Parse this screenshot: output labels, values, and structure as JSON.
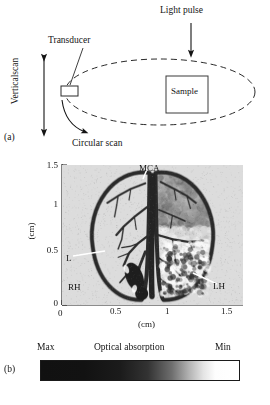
{
  "figure": {
    "panel_a_label": "(a)",
    "panel_b_label": "(b)"
  },
  "schematic": {
    "light_pulse": "Light pulse",
    "transducer": "Transducer",
    "sample": "Sample",
    "circular_scan": "Circular scan",
    "vertical_scan": "Verticalscan"
  },
  "image_panel": {
    "annotations": {
      "mca": "MCA",
      "l": "L",
      "rh": "RH",
      "lh": "LH"
    },
    "x_axis": {
      "title": "(cm)",
      "ticks": [
        "0",
        "0.5",
        "1",
        "1.5"
      ]
    },
    "y_axis": {
      "title": "(cm)",
      "ticks": [
        "1.5",
        "1",
        "0.5",
        "0"
      ]
    }
  },
  "colorbar": {
    "max_label": "Max",
    "title": "Optical absorption",
    "min_label": "Min",
    "max_color": "#111111",
    "min_color": "#ffffff"
  },
  "chart_data": {
    "type": "heatmap",
    "xlabel": "(cm)",
    "ylabel": "(cm)",
    "xlim": [
      0,
      1.5
    ],
    "ylim": [
      0,
      1.5
    ],
    "xticks": [
      0,
      0.5,
      1,
      1.5
    ],
    "yticks": [
      0,
      0.5,
      1,
      1.5
    ],
    "grid": false,
    "colormap": "grayscale_inverted",
    "colorbar": {
      "label": "Optical absorption",
      "high_end_label": "Max",
      "low_end_label": "Min",
      "high_end_color": "#111111",
      "low_end_color": "#ffffff"
    },
    "annotations": [
      {
        "text": "MCA",
        "x": 0.78,
        "y": 1.44,
        "points_to_x": 0.75,
        "points_to_y": 1.26
      },
      {
        "text": "L",
        "x": 0.06,
        "y": 0.6,
        "points_to_x": 0.36,
        "points_to_y": 0.52
      },
      {
        "text": "RH",
        "x": 0.08,
        "y": 0.18
      },
      {
        "text": "LH",
        "x": 1.3,
        "y": 0.2,
        "points_to_x": 1.12,
        "points_to_y": 0.31
      }
    ]
  }
}
